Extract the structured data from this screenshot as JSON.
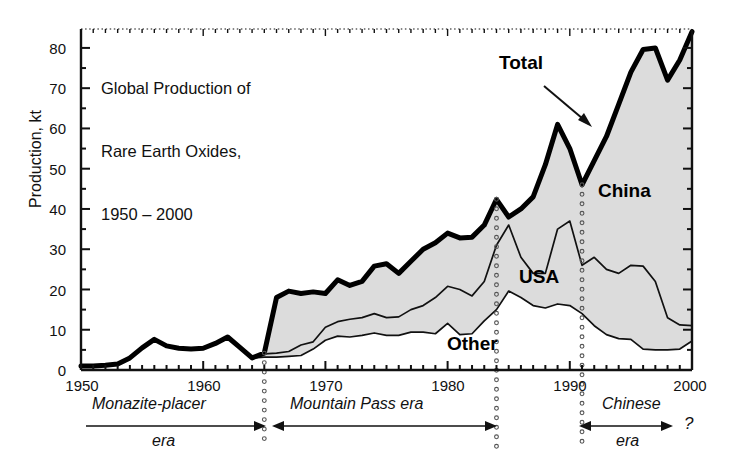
{
  "figure": {
    "title_lines": [
      "Global Production of",
      "Rare Earth Oxides,",
      "1950 – 2000"
    ],
    "ylabel": "Production, kt",
    "question_mark": "?"
  },
  "chart_data": {
    "type": "area",
    "title": "Global Production of Rare Earth Oxides, 1950 – 2000",
    "xlabel": "",
    "ylabel": "Production, kt",
    "xlim": [
      1950,
      2000
    ],
    "ylim": [
      0,
      84.7
    ],
    "yticks": [
      0,
      10,
      20,
      30,
      40,
      50,
      60,
      70,
      80
    ],
    "yticks_minor_step": 5,
    "xticks": [
      1950,
      1960,
      1970,
      1980,
      1990,
      2000
    ],
    "xticks_minor_step": 1,
    "grid": false,
    "legend": "inline-annotations",
    "stacking": "cumulative (Other at bottom, then USA, then China up to Total)",
    "x": [
      1950,
      1951,
      1952,
      1953,
      1954,
      1955,
      1956,
      1957,
      1958,
      1959,
      1960,
      1961,
      1962,
      1963,
      1964,
      1965,
      1966,
      1967,
      1968,
      1969,
      1970,
      1971,
      1972,
      1973,
      1974,
      1975,
      1976,
      1977,
      1978,
      1979,
      1980,
      1981,
      1982,
      1983,
      1984,
      1985,
      1986,
      1987,
      1988,
      1989,
      1990,
      1991,
      1992,
      1993,
      1994,
      1995,
      1996,
      1997,
      1998,
      1999,
      2000
    ],
    "series": [
      {
        "name": "Total",
        "label": "Total",
        "style": "thick black line (upper envelope)",
        "values": [
          1.0,
          1.0,
          1.2,
          1.5,
          3.0,
          5.5,
          7.6,
          6.0,
          5.4,
          5.2,
          5.4,
          6.6,
          8.2,
          5.6,
          3.0,
          4.2,
          18.0,
          19.6,
          19.0,
          19.4,
          19.0,
          22.4,
          21.0,
          22.0,
          25.8,
          26.4,
          24.0,
          27.0,
          30.0,
          31.6,
          34.0,
          32.8,
          33.0,
          36.0,
          42.4,
          38.0,
          40.0,
          43.0,
          51.0,
          61.0,
          55.0,
          46.0,
          52.0,
          58.0,
          66.0,
          74.0,
          79.6,
          80.0,
          72.0,
          77.0,
          84.0
        ]
      },
      {
        "name": "Other + USA",
        "label": "USA",
        "style": "thin black line (boundary between USA band and China band)",
        "values": [
          1.0,
          1.0,
          1.2,
          1.5,
          3.0,
          5.5,
          7.6,
          6.0,
          5.4,
          5.2,
          5.4,
          6.6,
          8.2,
          5.6,
          3.0,
          4.0,
          4.2,
          4.6,
          6.2,
          7.0,
          10.6,
          12.0,
          12.6,
          13.0,
          14.0,
          13.0,
          13.2,
          15.0,
          16.0,
          18.0,
          20.8,
          20.0,
          18.4,
          22.0,
          31.0,
          36.0,
          28.0,
          24.0,
          24.0,
          35.0,
          37.0,
          26.0,
          28.0,
          25.0,
          24.0,
          26.0,
          25.8,
          22.0,
          13.0,
          11.2,
          11.0
        ]
      },
      {
        "name": "Other",
        "label": "Other",
        "style": "thin black line (lower band boundary)",
        "values": [
          1.0,
          1.0,
          1.2,
          1.5,
          3.0,
          5.5,
          7.6,
          6.0,
          5.4,
          5.2,
          5.4,
          6.6,
          8.2,
          5.6,
          3.0,
          3.2,
          3.2,
          3.4,
          3.6,
          5.2,
          7.4,
          8.4,
          8.2,
          8.6,
          9.2,
          8.6,
          8.6,
          9.4,
          9.4,
          9.0,
          11.6,
          8.8,
          9.0,
          12.2,
          15.0,
          19.6,
          18.0,
          16.0,
          15.4,
          16.4,
          16.0,
          14.0,
          11.0,
          8.8,
          7.8,
          7.6,
          5.2,
          5.0,
          5.0,
          5.2,
          7.2
        ]
      }
    ],
    "bands": [
      {
        "name": "China",
        "label": "China",
        "fill": "light grey",
        "between": [
          "Other + USA",
          "Total"
        ]
      },
      {
        "name": "USA",
        "label": "USA",
        "fill": "light grey",
        "between": [
          "Other",
          "Other + USA"
        ]
      },
      {
        "name": "Other",
        "label": "Other",
        "fill": "white",
        "between": [
          "zero",
          "Other"
        ]
      }
    ],
    "annotations": [
      {
        "text": "Total",
        "type": "series-label-with-arrow",
        "x": 1988,
        "y": 73
      },
      {
        "text": "China",
        "type": "band-label",
        "x": 1993,
        "y": 38
      },
      {
        "text": "USA",
        "type": "band-label",
        "x": 1986.5,
        "y": 25
      },
      {
        "text": "Other",
        "type": "band-label",
        "x": 1982,
        "y": 7
      }
    ],
    "era_markers": [
      {
        "label_lines": [
          "Monazite-placer",
          "era"
        ],
        "start": 1950,
        "end": 1965,
        "arrow": "right"
      },
      {
        "label_lines": [
          "Mountain Pass era"
        ],
        "start": 1965,
        "end": 1984,
        "arrow": "both"
      },
      {
        "label_lines": [
          "Chinese",
          "era"
        ],
        "start": 1991,
        "end": 1998,
        "arrow": "both",
        "trailing": "?"
      }
    ],
    "dotted_verticals": [
      1965,
      1984,
      1991
    ]
  },
  "axis": {
    "ytick_labels": [
      "80",
      "70",
      "60",
      "50",
      "40",
      "30",
      "20",
      "10",
      "0"
    ],
    "xtick_labels": [
      "1950",
      "1960",
      "1970",
      "1980",
      "1990",
      "2000"
    ]
  },
  "labels": {
    "total": "Total",
    "china": "China",
    "usa": "USA",
    "other": "Other",
    "era1_line1": "Monazite-placer",
    "era1_line2": "era",
    "era2_line1": "Mountain Pass era",
    "era3_line1": "Chinese",
    "era3_line2": "era"
  },
  "colors": {
    "ink": "#111111",
    "band_fill": "#dcdcdc",
    "background": "#ffffff"
  }
}
